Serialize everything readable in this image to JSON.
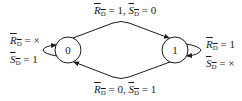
{
  "diagram": {
    "type": "state-transition",
    "states": [
      {
        "id": "s0",
        "label": "0"
      },
      {
        "id": "s1",
        "label": "1"
      }
    ],
    "transitions": {
      "top": {
        "from": "0",
        "to": "1",
        "r_var": "R",
        "r_sub": "D",
        "r_val": " = 1, ",
        "s_var": "S",
        "s_sub": "D",
        "s_val": " = 0"
      },
      "bottom": {
        "from": "1",
        "to": "0",
        "r_var": "R",
        "r_sub": "D",
        "r_val": " = 0, ",
        "s_var": "S",
        "s_sub": "D",
        "s_val": " = 1"
      },
      "loop0": {
        "from": "0",
        "to": "0",
        "r_var": "R",
        "r_sub": "D",
        "r_val": " = ×",
        "s_var": "S",
        "s_sub": "D",
        "s_val": " = 1"
      },
      "loop1": {
        "from": "1",
        "to": "1",
        "r_var": "R",
        "r_sub": "D",
        "r_val": " = 1",
        "s_var": "S",
        "s_sub": "D",
        "s_val": " = ×"
      }
    },
    "colors": {
      "stroke": "#1a1a1a",
      "background": "#ffffff"
    }
  }
}
